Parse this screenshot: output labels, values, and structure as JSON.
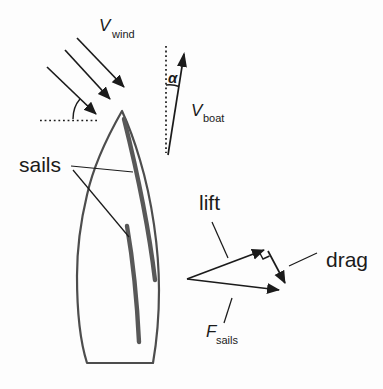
{
  "colors": {
    "background": "#fdfdfd",
    "ink": "#1b1b1b",
    "hull_outline": "#4d4d4d",
    "sail_stroke": "#585858"
  },
  "labels": {
    "v_wind": {
      "symbol": "V",
      "subscript": "wind"
    },
    "v_boat": {
      "symbol": "V",
      "subscript": "boat"
    },
    "alpha": {
      "symbol": "α"
    },
    "sails": {
      "text": "sails"
    },
    "lift": {
      "text": "lift"
    },
    "drag": {
      "text": "drag"
    },
    "f_sails": {
      "symbol": "F",
      "subscript": "sails"
    }
  }
}
